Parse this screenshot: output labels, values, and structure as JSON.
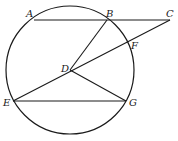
{
  "diagram": {
    "circle": {
      "cx": 70,
      "cy": 70,
      "r": 64
    },
    "points": {
      "A": {
        "label": "A",
        "x": 34,
        "y": 20,
        "lx": 26,
        "ly": 17
      },
      "B": {
        "label": "B",
        "x": 107,
        "y": 20,
        "lx": 106,
        "ly": 17
      },
      "C": {
        "label": "C",
        "x": 170,
        "y": 20,
        "lx": 166,
        "ly": 17
      },
      "F": {
        "label": "F",
        "x": 127,
        "y": 43,
        "lx": 131,
        "ly": 49
      },
      "D": {
        "label": "D",
        "x": 70,
        "y": 70,
        "lx": 61,
        "ly": 72
      },
      "E": {
        "label": "E",
        "x": 13,
        "y": 101,
        "lx": 3,
        "ly": 106
      },
      "G": {
        "label": "G",
        "x": 126,
        "y": 101,
        "lx": 129,
        "ly": 106
      }
    },
    "segments": [
      [
        "A",
        "C"
      ],
      [
        "B",
        "D"
      ],
      [
        "C",
        "E"
      ],
      [
        "D",
        "G"
      ],
      [
        "E",
        "G"
      ]
    ],
    "stroke": "#1a1a1a"
  }
}
